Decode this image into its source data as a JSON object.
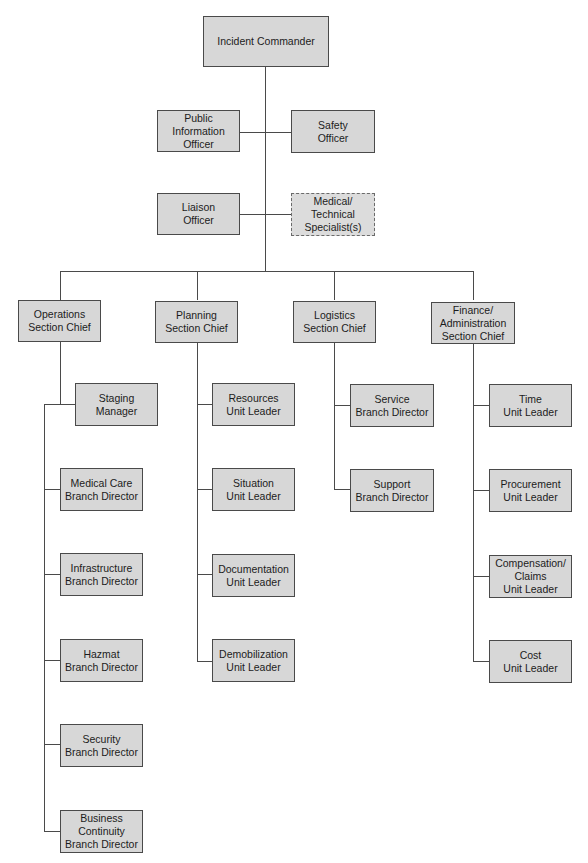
{
  "chart": {
    "command": {
      "incident_commander": "Incident Commander",
      "public_information_officer": "Public\nInformation\nOfficer",
      "safety_officer": "Safety\nOfficer",
      "liaison_officer": "Liaison\nOfficer",
      "medical_technical_specialists": "Medical/\nTechnical\nSpecialist(s)"
    },
    "sections": [
      {
        "label": "Operations\nSection Chief",
        "children": [
          "Staging Manager",
          "Medical Care\nBranch Director",
          "Infrastructure\nBranch Director",
          "Hazmat\nBranch Director",
          "Security\nBranch Director",
          "Business\nContinuity\nBranch Director"
        ]
      },
      {
        "label": "Planning\nSection Chief",
        "children": [
          "Resources\nUnit Leader",
          "Situation\nUnit Leader",
          "Documentation\nUnit Leader",
          "Demobilization\nUnit Leader"
        ]
      },
      {
        "label": "Logistics\nSection Chief",
        "children": [
          "Service\nBranch Director",
          "Support\nBranch Director"
        ]
      },
      {
        "label": "Finance/\nAdministration\nSection Chief",
        "children": [
          "Time\nUnit Leader",
          "Procurement\nUnit Leader",
          "Compensation/\nClaims\nUnit Leader",
          "Cost\nUnit Leader"
        ]
      }
    ],
    "colors": {
      "box_fill": "#d7d7d7",
      "box_border": "#4a4a4a",
      "line": "#4a4a4a",
      "background": "#ffffff"
    }
  }
}
